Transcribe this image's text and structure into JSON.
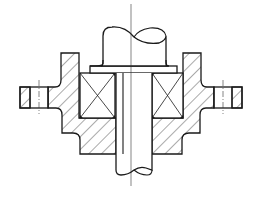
{
  "figure": {
    "title": "Bearing housing with shaft - sectional view",
    "type": "mechanical cross-section drawing",
    "width": 262,
    "height": 197,
    "colors": {
      "stroke": "#1a1a1a",
      "background": "#ffffff",
      "hatch": "#2a2a2a"
    },
    "components": [
      {
        "id": "shaft",
        "label": "Shaft"
      },
      {
        "id": "shaft-collar",
        "label": "Shaft collar / washer"
      },
      {
        "id": "bearing-left",
        "label": "Rolling bearing (left)"
      },
      {
        "id": "bearing-right",
        "label": "Rolling bearing (right)"
      },
      {
        "id": "housing-left",
        "label": "Housing (left section)"
      },
      {
        "id": "housing-right",
        "label": "Housing (right section)"
      },
      {
        "id": "flange-left",
        "label": "Flange bolt hole (left)"
      },
      {
        "id": "flange-right",
        "label": "Flange bolt hole (right)"
      },
      {
        "id": "centerline",
        "label": "Axis centerline"
      }
    ]
  }
}
